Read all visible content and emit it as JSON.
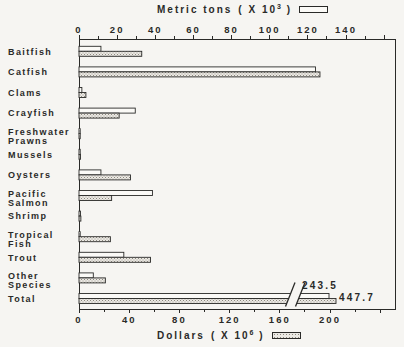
{
  "figure": {
    "top_legend": {
      "label": "Metric tons",
      "unit_open": "( X 10",
      "unit_exp": "3",
      "unit_close": " )"
    },
    "bottom_legend": {
      "label": "Dollars",
      "unit_open": "( X 10",
      "unit_exp": "6",
      "unit_close": " )"
    }
  },
  "colors": {
    "ink": "#2a2a28",
    "paper": "#f6f5f2",
    "bar_open_fill": "#fbfaf7",
    "stipple_bg": "#ebe9e4",
    "stipple_dot": "#8d897f"
  },
  "chart_data": {
    "type": "bar",
    "orientation": "horizontal-grouped-dual-axis",
    "title": "",
    "top_axis": {
      "label": "Metric tons ( X 10^3 )",
      "tick_labels": [
        0,
        20,
        40,
        60,
        80,
        100,
        120,
        140
      ],
      "minor_step": 10,
      "range": [
        0,
        160
      ],
      "units_per_major_tick": 20
    },
    "bottom_axis": {
      "label": "Dollars ( X 10^6 )",
      "tick_labels": [
        0,
        40,
        80,
        120,
        160,
        200
      ],
      "minor_step": 20,
      "range": [
        0,
        240
      ],
      "units_per_major_tick": 40
    },
    "categories": [
      "Baitfish",
      "Catfish",
      "Clams",
      "Crayfish",
      "Freshwater\nPrawns",
      "Mussels",
      "Oysters",
      "Pacific\nSalmon",
      "Shrimp",
      "Tropical\nFish",
      "Trout",
      "Other\nSpecies",
      "Total"
    ],
    "series": [
      {
        "name": "Metric tons (X 10^3)",
        "style": "open-bar",
        "values": [
          11.5,
          124,
          1.5,
          29.5,
          0.4,
          0.6,
          11.5,
          38.5,
          0.8,
          0.5,
          23.5,
          7.5,
          243.5
        ]
      },
      {
        "name": "Dollars (X 10^6)",
        "style": "stipple-bar",
        "values": [
          50,
          192,
          5.5,
          32,
          0.8,
          1.2,
          41,
          26,
          1.5,
          25,
          57,
          21,
          447.7
        ]
      }
    ],
    "annotations": [
      {
        "text": "243.5",
        "target": "Total metric tons bar"
      },
      {
        "text": "447.7",
        "target": "Total dollars bar"
      }
    ],
    "axis_break": {
      "row": "Total",
      "mark": "double-slash through both Total bars near right edge"
    },
    "legend_position": "top-and-bottom",
    "grid": false
  }
}
